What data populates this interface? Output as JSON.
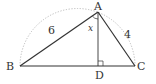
{
  "diagram": {
    "type": "triangle-in-semicircle",
    "points": {
      "A": {
        "label": "A",
        "x": 98,
        "y": 12
      },
      "B": {
        "label": "B",
        "x": 20,
        "y": 66
      },
      "C": {
        "label": "C",
        "x": 135,
        "y": 66
      },
      "D": {
        "label": "D",
        "x": 98,
        "y": 66
      }
    },
    "lengths": {
      "AB": "6",
      "AC": "4"
    },
    "angle_label": "x",
    "right_angle_at": "D",
    "colors": {
      "line": "#333333",
      "arc": "#aaaaaa"
    }
  }
}
